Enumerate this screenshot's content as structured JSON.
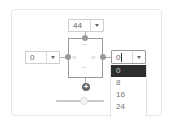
{
  "margin_editor": {
    "top": {
      "value": "44"
    },
    "left": {
      "value": "0"
    },
    "right": {
      "value": "0",
      "focused": true
    },
    "dropdown_options": [
      "0",
      "8",
      "16",
      "24"
    ],
    "selected_option": "0",
    "icons": {
      "top_handle": "chevron-double-down",
      "bottom_handle": "chevron-double-up",
      "left_handle": "chevron-double-right",
      "right_handle": "chevron-double-left",
      "add": "plus-circle"
    },
    "plus_symbol": "+",
    "chevrons": {
      "down": "ˇˇ",
      "up": "ˆˆ",
      "right": "››",
      "left": "‹‹"
    }
  },
  "colors": {
    "selected_option_bg": "#2e2e2e",
    "border": "#cfcfcf",
    "handle": "#9a9a9a"
  }
}
